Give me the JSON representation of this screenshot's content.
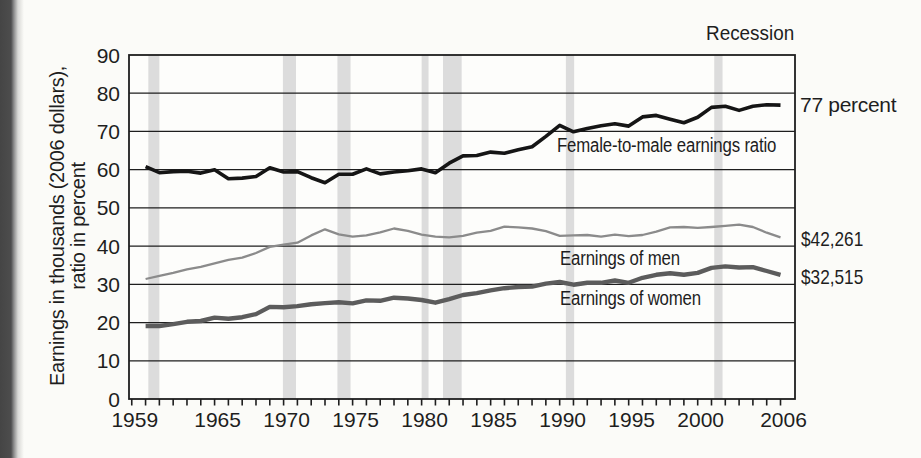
{
  "page": {
    "background_color": "#fbfbf8",
    "binding_strip_color": "#4a4a4a"
  },
  "labels": {
    "recession": "Recession",
    "y_axis_title_line1": "Earnings in thousands (2006 dollars),",
    "y_axis_title_line2": "ratio in percent",
    "ratio_series": "Female-to-male earnings ratio",
    "men_series": "Earnings of men",
    "women_series": "Earnings of women",
    "ratio_end": "77 percent",
    "men_end": "$42,261",
    "women_end": "$32,515"
  },
  "chart_data": {
    "type": "line",
    "title": "",
    "ylabel": "Earnings in thousands (2006 dollars), ratio in percent",
    "xlabel": "",
    "legend_position": "top-right",
    "grid": true,
    "grid_color": "#1e1e1e",
    "axis_text_color": "#1e1e1e",
    "x_axis": {
      "min": 1958.8,
      "max": 2007.05,
      "tick_start_year": 1959,
      "tick_end_year": 2006,
      "labeled_ticks": [
        1959,
        1965,
        1970,
        1975,
        1980,
        1985,
        1990,
        1995,
        2000,
        2006
      ]
    },
    "y_axis": {
      "min": 0,
      "max": 90,
      "tick_step": 10,
      "tick_labels": [
        0,
        10,
        20,
        30,
        40,
        50,
        60,
        70,
        80,
        90
      ],
      "interior_gridlines": [
        10,
        20,
        30,
        40,
        50,
        60,
        70,
        80
      ]
    },
    "start_year": 1960,
    "years": [
      1960,
      1961,
      1962,
      1963,
      1964,
      1965,
      1966,
      1967,
      1968,
      1969,
      1970,
      1971,
      1972,
      1973,
      1974,
      1975,
      1976,
      1977,
      1978,
      1979,
      1980,
      1981,
      1982,
      1983,
      1984,
      1985,
      1986,
      1987,
      1988,
      1989,
      1990,
      1991,
      1992,
      1993,
      1994,
      1995,
      1996,
      1997,
      1998,
      1999,
      2000,
      2001,
      2002,
      2003,
      2004,
      2005,
      2006
    ],
    "series": [
      {
        "key": "ratio",
        "name": "Female-to-male earnings ratio",
        "unit": "percent",
        "color": "#151515",
        "stroke_width": 3.6,
        "end_label": "77 percent",
        "end_value": 77,
        "values": [
          60.8,
          59.2,
          59.5,
          59.6,
          59.1,
          60.0,
          57.6,
          57.8,
          58.2,
          60.5,
          59.4,
          59.5,
          57.9,
          56.6,
          58.8,
          58.8,
          60.2,
          58.9,
          59.4,
          59.7,
          60.2,
          59.2,
          61.7,
          63.6,
          63.7,
          64.6,
          64.3,
          65.2,
          66.0,
          68.7,
          71.6,
          69.9,
          70.8,
          71.5,
          72.0,
          71.4,
          73.8,
          74.2,
          73.2,
          72.3,
          73.7,
          76.3,
          76.6,
          75.5,
          76.6,
          77.0,
          76.9
        ]
      },
      {
        "key": "men",
        "name": "Earnings of men",
        "unit": "thousands of 2006 dollars",
        "color": "#8b8b8b",
        "stroke_width": 2.3,
        "end_label": "$42,261",
        "end_value": 42.261,
        "values": [
          31.4,
          32.2,
          33.0,
          33.9,
          34.6,
          35.5,
          36.4,
          37.0,
          38.2,
          39.8,
          40.4,
          40.9,
          42.8,
          44.4,
          43.1,
          42.5,
          42.8,
          43.6,
          44.6,
          44.0,
          43.0,
          42.5,
          42.3,
          42.7,
          43.5,
          44.0,
          45.1,
          44.9,
          44.6,
          43.9,
          42.7,
          42.8,
          42.9,
          42.5,
          43.0,
          42.6,
          42.9,
          43.8,
          44.9,
          45.0,
          44.8,
          45.0,
          45.3,
          45.6,
          45.0,
          43.5,
          42.3
        ]
      },
      {
        "key": "women",
        "name": "Earnings of women",
        "unit": "thousands of 2006 dollars",
        "color": "#5c5c5c",
        "stroke_width": 4.4,
        "end_label": "$32,515",
        "end_value": 32.515,
        "values": [
          19.1,
          19.1,
          19.6,
          20.2,
          20.4,
          21.3,
          21.0,
          21.4,
          22.2,
          24.1,
          24.0,
          24.3,
          24.8,
          25.1,
          25.3,
          25.0,
          25.8,
          25.7,
          26.5,
          26.3,
          25.9,
          25.2,
          26.1,
          27.2,
          27.7,
          28.4,
          29.0,
          29.3,
          29.4,
          30.2,
          30.6,
          29.9,
          30.4,
          30.4,
          31.0,
          30.4,
          31.7,
          32.5,
          32.9,
          32.5,
          33.0,
          34.3,
          34.7,
          34.4,
          34.5,
          33.5,
          32.5
        ]
      }
    ],
    "recession_bands": [
      [
        1960.2,
        1961.0
      ],
      [
        1969.95,
        1970.9
      ],
      [
        1973.9,
        1974.85
      ],
      [
        1980.0,
        1980.5
      ],
      [
        1981.55,
        1982.9
      ],
      [
        1990.45,
        1991.05
      ],
      [
        2001.2,
        2001.8
      ]
    ],
    "recession_band_color": "#dcdcdc",
    "recession_legend": "Recession"
  }
}
